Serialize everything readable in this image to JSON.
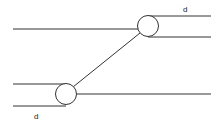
{
  "diagram": {
    "title": "",
    "background": "#ffffff",
    "line_color": "#333333",
    "labels": [
      {
        "id": "top-d",
        "text": "d",
        "x": 183,
        "y": 12
      },
      {
        "id": "bottom-d",
        "text": "d",
        "x": 34,
        "y": 119
      }
    ],
    "nodes": [
      {
        "id": "top-circle",
        "cx": 148,
        "cy": 26,
        "r": 10.5
      },
      {
        "id": "bottom-circle",
        "cx": 66,
        "cy": 94,
        "r": 10.5
      }
    ],
    "lines": [
      {
        "id": "top-left-line",
        "x1": 13,
        "y1": 29,
        "x2": 138,
        "y2": 29
      },
      {
        "id": "top-right-upper-line",
        "x1": 148,
        "y1": 16,
        "x2": 211,
        "y2": 16
      },
      {
        "id": "top-right-lower-line",
        "x1": 148,
        "y1": 37,
        "x2": 211,
        "y2": 37
      },
      {
        "id": "bottom-left-upper-line",
        "x1": 13,
        "y1": 84,
        "x2": 66,
        "y2": 84
      },
      {
        "id": "bottom-left-lower-line",
        "x1": 13,
        "y1": 106,
        "x2": 66,
        "y2": 106
      },
      {
        "id": "bottom-right-line",
        "x1": 77,
        "y1": 94,
        "x2": 211,
        "y2": 94
      },
      {
        "id": "diagonal-connector",
        "x1": 73,
        "y1": 87,
        "x2": 140,
        "y2": 33
      }
    ]
  }
}
